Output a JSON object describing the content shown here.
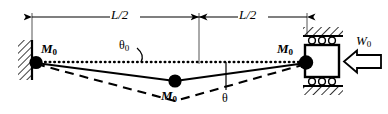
{
  "figure": {
    "colors": {
      "line": "#000000",
      "background": "#ffffff",
      "hatch": "#000000"
    },
    "dimensions": {
      "left_span_label": "L/2",
      "right_span_label": "L/2"
    },
    "labels": {
      "mass_left": "M",
      "mass_left_sub": "0",
      "mass_mid": "M",
      "mass_mid_sub": "0",
      "mass_right": "M",
      "mass_right_sub": "0",
      "force": "W",
      "force_sub": "0",
      "angle_initial": "θ",
      "angle_initial_sub": "0",
      "angle_current": "θ"
    },
    "supports": {
      "left": "fixed-wall-hatched",
      "right": "roller-slider-guided"
    },
    "curves": {
      "undeformed": "dotted-horizontal",
      "state_solid": "solid-vee",
      "state_dashed": "dashed-vee-deeper"
    }
  }
}
